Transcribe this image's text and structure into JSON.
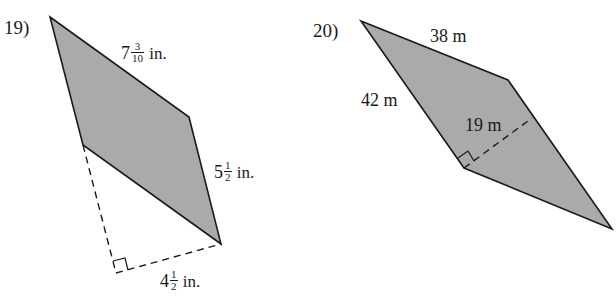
{
  "colors": {
    "fill": "#aaaaaa",
    "stroke": "#1a1a1a",
    "background": "#ffffff"
  },
  "problems": [
    {
      "number": "19)",
      "shape": "parallelogram",
      "labels": {
        "top_side": {
          "whole": "7",
          "numerator": "3",
          "denominator": "10",
          "unit": "in."
        },
        "right_side": {
          "whole": "5",
          "numerator": "1",
          "denominator": "2",
          "unit": "in."
        },
        "height": {
          "whole": "4",
          "numerator": "1",
          "denominator": "2",
          "unit": "in."
        }
      },
      "height_is_dashed": true,
      "right_angle_marker": true
    },
    {
      "number": "20)",
      "shape": "parallelogram",
      "labels": {
        "top_side": "38 m",
        "left_side": "42 m",
        "height": "19 m"
      },
      "height_is_dashed": true,
      "right_angle_marker": true
    }
  ]
}
